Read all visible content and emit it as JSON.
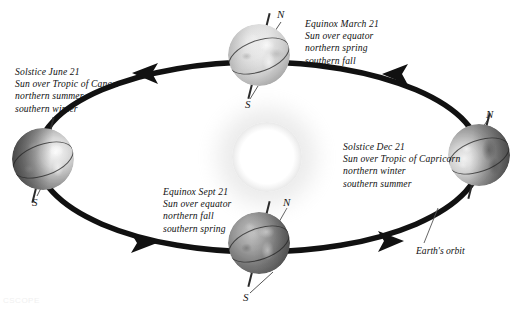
{
  "diagram": {
    "sun": {
      "name": "Sun",
      "color": "#ffffff",
      "glow_color": "#e4e4e4"
    },
    "orbit": {
      "label": "Earth's orbit",
      "color": "#111111",
      "direction": "counterclockwise",
      "arrow_count": 4
    },
    "positions": [
      {
        "id": "march-equinox",
        "lines": [
          "Equinox March 21",
          "Sun over equator",
          "northern spring",
          "southern fall"
        ],
        "pole_top": "N",
        "pole_bottom": "S"
      },
      {
        "id": "june-solstice",
        "lines": [
          "Solstice June 21",
          "Sun over Tropic of Cancer",
          "northern summer",
          "southern winter"
        ],
        "pole_bottom": "S"
      },
      {
        "id": "september-equinox",
        "lines": [
          "Equinox Sept 21",
          "Sun over equator",
          "northern fall",
          "southern spring"
        ],
        "pole_top": "N",
        "pole_bottom": "S"
      },
      {
        "id": "december-solstice",
        "lines": [
          "Solstice Dec 21",
          "Sun over Tropic of Capricorn",
          "northern winter",
          "southern summer"
        ],
        "pole_top": "N"
      }
    ],
    "watermark": "CSCOPE"
  }
}
